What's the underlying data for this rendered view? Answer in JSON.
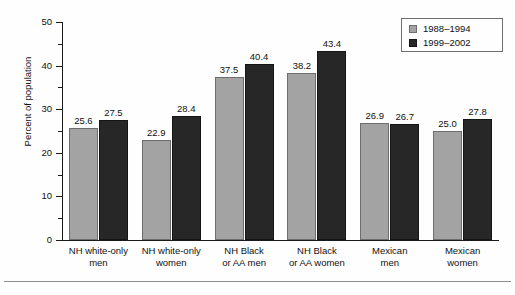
{
  "chart_data": {
    "type": "bar",
    "title": "",
    "xlabel": "",
    "ylabel": "Percent of population",
    "ylim": [
      0,
      50
    ],
    "ytick_labels": [
      "0",
      "10",
      "20",
      "30",
      "40",
      "50"
    ],
    "ytick_values": [
      0,
      10,
      20,
      30,
      40,
      50
    ],
    "minor_ytick_values": [
      5,
      15,
      25,
      35,
      45
    ],
    "grid": false,
    "legend_position": "top-right",
    "categories": [
      "NH white-only men",
      "NH white-only women",
      "NH Black or AA men",
      "NH Black or AA women",
      "Mexican men",
      "Mexican women"
    ],
    "category_lines": [
      [
        "NH white-only",
        "men"
      ],
      [
        "NH white-only",
        "women"
      ],
      [
        "NH Black",
        "or AA men"
      ],
      [
        "NH Black",
        "or AA women"
      ],
      [
        "Mexican",
        "men"
      ],
      [
        "Mexican",
        "women"
      ]
    ],
    "series": [
      {
        "name": "1988–1994",
        "color": "#a3a3a3",
        "values": [
          25.6,
          22.9,
          37.5,
          38.2,
          26.9,
          25.0
        ],
        "value_labels": [
          "25.6",
          "22.9",
          "37.5",
          "38.2",
          "26.9",
          "25.0"
        ]
      },
      {
        "name": "1999–2002",
        "color": "#272727",
        "values": [
          27.5,
          28.4,
          40.4,
          43.4,
          26.7,
          27.8
        ],
        "value_labels": [
          "27.5",
          "28.4",
          "40.4",
          "43.4",
          "26.7",
          "27.8"
        ]
      }
    ]
  },
  "legend": {
    "items": [
      {
        "label": "1988–1994",
        "swatch": "gray-swatch"
      },
      {
        "label": "1999–2002",
        "swatch": "black-swatch"
      }
    ]
  },
  "axes": {
    "y_title": "Percent of population",
    "y_labels": [
      "50",
      "40",
      "30",
      "20",
      "10",
      "0"
    ]
  }
}
